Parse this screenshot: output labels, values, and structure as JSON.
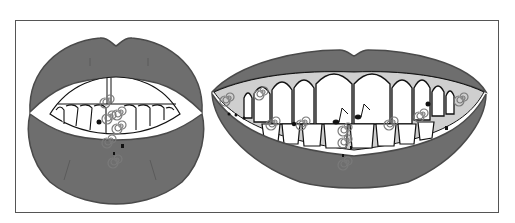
{
  "figure": {
    "colors": {
      "lip": "#6e6e6e",
      "lip_edge": "#4a4a4a",
      "gum": "#cfcfcf",
      "tooth": "#ffffff",
      "outline": "#111111",
      "spiral": "#8a8a8a",
      "frame": "#555555"
    },
    "panels": [
      {
        "id": "left-mouth",
        "label": "Slightly open mouth, front view"
      },
      {
        "id": "right-mouth",
        "label": "Smiling mouth showing teeth"
      }
    ],
    "ornaments": {
      "spiral_count_left": 6,
      "spiral_count_right": 10,
      "music_notes": 2
    }
  }
}
